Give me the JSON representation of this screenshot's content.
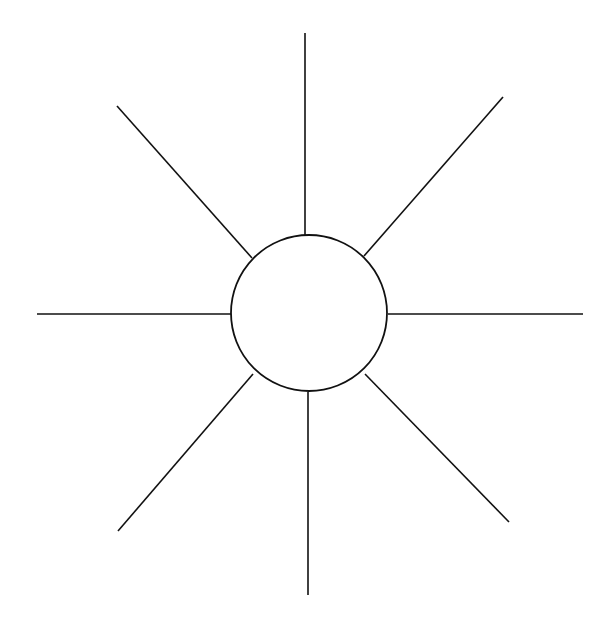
{
  "diagram": {
    "type": "sun-organizer",
    "colors": {
      "background": "#ffffff",
      "stroke": "#111111"
    },
    "hub": {
      "label": "",
      "cx": 309,
      "cy": 313,
      "r": 78
    },
    "spokes": [
      {
        "id": "north",
        "label": "",
        "x1": 305,
        "y1": 33,
        "x2": 305,
        "y2": 235
      },
      {
        "id": "north-east",
        "label": "",
        "x1": 503,
        "y1": 97,
        "x2": 364,
        "y2": 256
      },
      {
        "id": "east",
        "label": "",
        "x1": 388,
        "y1": 314,
        "x2": 583,
        "y2": 314
      },
      {
        "id": "south-east",
        "label": "",
        "x1": 365,
        "y1": 374,
        "x2": 509,
        "y2": 522
      },
      {
        "id": "south",
        "label": "",
        "x1": 308,
        "y1": 392,
        "x2": 308,
        "y2": 595
      },
      {
        "id": "south-west",
        "label": "",
        "x1": 253,
        "y1": 374,
        "x2": 118,
        "y2": 531
      },
      {
        "id": "west",
        "label": "",
        "x1": 37,
        "y1": 314,
        "x2": 231,
        "y2": 314
      },
      {
        "id": "north-west",
        "label": "",
        "x1": 117,
        "y1": 106,
        "x2": 252,
        "y2": 258
      }
    ]
  }
}
